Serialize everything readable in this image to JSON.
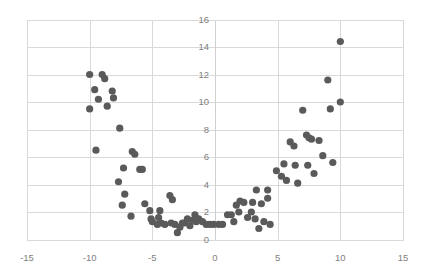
{
  "chart_data": {
    "type": "scatter",
    "title": "",
    "subtitle": "",
    "xlabel": "",
    "ylabel": "",
    "xlim": [
      -15,
      15
    ],
    "ylim": [
      0,
      16
    ],
    "xticks": [
      -15,
      -10,
      -5,
      0,
      5,
      10,
      15
    ],
    "yticks": [
      0,
      2,
      4,
      6,
      8,
      10,
      12,
      14,
      16
    ],
    "xtick_labels": [
      "-15",
      "-10",
      "-5",
      "0",
      "5",
      "10",
      "15"
    ],
    "ytick_labels": [
      "0",
      "2",
      "4",
      "6",
      "8",
      "10",
      "12",
      "14",
      "16"
    ],
    "grid": true,
    "grid_axis": "both",
    "legend": false,
    "legend_position": "none",
    "marker_color": "#5a5a5a",
    "marker_size": 5.2,
    "grid_color": "#d9d9d9",
    "tick_color": "#7f7f7f",
    "background_color": "#ffffff",
    "series": [
      {
        "name": "series1",
        "points": [
          [
            -10.0,
            12.0
          ],
          [
            -10.0,
            9.5
          ],
          [
            -9.6,
            10.9
          ],
          [
            -9.5,
            6.5
          ],
          [
            -9.3,
            10.2
          ],
          [
            -9.0,
            12.0
          ],
          [
            -8.8,
            11.7
          ],
          [
            -8.6,
            9.7
          ],
          [
            -8.2,
            10.8
          ],
          [
            -8.1,
            10.3
          ],
          [
            -7.6,
            8.1
          ],
          [
            -7.7,
            4.2
          ],
          [
            -7.3,
            5.2
          ],
          [
            -7.2,
            3.3
          ],
          [
            -7.4,
            2.5
          ],
          [
            -6.6,
            6.4
          ],
          [
            -6.4,
            6.2
          ],
          [
            -6.7,
            1.7
          ],
          [
            -6.0,
            5.1
          ],
          [
            -5.8,
            5.1
          ],
          [
            -5.6,
            2.6
          ],
          [
            -5.2,
            2.1
          ],
          [
            -5.1,
            1.5
          ],
          [
            -5.0,
            1.3
          ],
          [
            -4.6,
            1.1
          ],
          [
            -4.4,
            2.1
          ],
          [
            -4.5,
            1.6
          ],
          [
            -4.3,
            1.2
          ],
          [
            -4.0,
            1.1
          ],
          [
            -3.6,
            3.2
          ],
          [
            -3.4,
            2.9
          ],
          [
            -3.5,
            1.2
          ],
          [
            -3.2,
            1.1
          ],
          [
            -3.0,
            0.5
          ],
          [
            -2.8,
            0.9
          ],
          [
            -2.6,
            1.2
          ],
          [
            -2.4,
            1.2
          ],
          [
            -2.2,
            1.5
          ],
          [
            -2.0,
            1.0
          ],
          [
            -1.8,
            1.4
          ],
          [
            -1.6,
            1.8
          ],
          [
            -1.5,
            1.3
          ],
          [
            -1.3,
            1.5
          ],
          [
            -1.0,
            1.3
          ],
          [
            -0.7,
            1.1
          ],
          [
            -0.4,
            1.1
          ],
          [
            -0.1,
            1.1
          ],
          [
            0.3,
            1.1
          ],
          [
            0.6,
            1.1
          ],
          [
            1.0,
            1.8
          ],
          [
            1.3,
            1.8
          ],
          [
            1.5,
            1.3
          ],
          [
            1.7,
            2.5
          ],
          [
            1.9,
            2.0
          ],
          [
            2.0,
            2.8
          ],
          [
            2.3,
            2.7
          ],
          [
            2.6,
            1.6
          ],
          [
            2.9,
            2.0
          ],
          [
            3.0,
            2.7
          ],
          [
            3.2,
            1.5
          ],
          [
            3.3,
            3.6
          ],
          [
            3.5,
            0.8
          ],
          [
            3.7,
            2.6
          ],
          [
            3.9,
            1.3
          ],
          [
            4.2,
            3.0
          ],
          [
            4.2,
            3.6
          ],
          [
            4.4,
            1.1
          ],
          [
            4.9,
            5.0
          ],
          [
            5.3,
            4.6
          ],
          [
            5.5,
            5.5
          ],
          [
            5.7,
            4.3
          ],
          [
            6.0,
            7.1
          ],
          [
            6.3,
            6.8
          ],
          [
            6.4,
            5.4
          ],
          [
            6.6,
            4.1
          ],
          [
            7.0,
            9.4
          ],
          [
            7.3,
            7.6
          ],
          [
            7.5,
            7.4
          ],
          [
            7.4,
            5.4
          ],
          [
            7.7,
            7.3
          ],
          [
            7.9,
            4.8
          ],
          [
            8.3,
            7.2
          ],
          [
            8.6,
            6.1
          ],
          [
            9.0,
            11.6
          ],
          [
            9.2,
            9.5
          ],
          [
            9.4,
            5.6
          ],
          [
            10.0,
            14.4
          ],
          [
            10.0,
            10.0
          ]
        ]
      }
    ]
  },
  "plot": {
    "area": {
      "left": 27,
      "top": 19.5,
      "right": 403,
      "bottom": 239.5
    }
  }
}
